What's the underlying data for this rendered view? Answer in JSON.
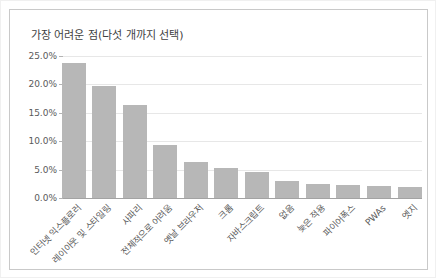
{
  "chart_data": {
    "type": "bar",
    "title": "가장 어려운 점(다섯 개까지 선택)",
    "categories": [
      "인터넷 익스플로러",
      "레이아웃 및 스타일링",
      "사파리",
      "전체적으로 어려움",
      "옛날 브라우저",
      "크롬",
      "자바스크립트",
      "없음",
      "늦은 적용",
      "파이어폭스",
      "PWAs",
      "엣지"
    ],
    "values": [
      23.8,
      19.8,
      16.4,
      9.3,
      6.4,
      5.2,
      4.5,
      3.0,
      2.4,
      2.3,
      2.2,
      2.0
    ],
    "value_unit": "%",
    "xlabel": "",
    "ylabel": "",
    "ylim": [
      0,
      25
    ],
    "y_tick_interval": 5,
    "y_tick_labels": [
      "25.0%",
      "20.0%",
      "15.0%",
      "10.0%",
      "5.0%",
      "0.0%"
    ],
    "grid": true,
    "legend": false,
    "x_label_rotation_deg": -45,
    "colors": {
      "bar": "#b7b7b7",
      "gridline": "#e7e7e7",
      "axis_line": "#a3a3a3",
      "tick": "#b3b3b3",
      "title_text": "#3f3f3f",
      "axis_text": "#5a5a5a",
      "panel_border": "#c9c9c9",
      "background": "#ffffff"
    }
  }
}
